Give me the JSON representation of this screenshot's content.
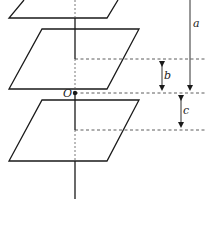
{
  "diagram": {
    "labels": {
      "a": "a",
      "b": "b",
      "c": "c",
      "origin": "O"
    },
    "elements": {
      "planes": [
        "top-plane",
        "middle-plane",
        "bottom-plane"
      ],
      "axis": "vertical-axis",
      "dimensions": [
        {
          "name": "a",
          "description": "distance from top to origin level"
        },
        {
          "name": "b",
          "description": "distance from middle dashed level to origin level"
        },
        {
          "name": "c",
          "description": "distance from origin level to lower dashed level"
        }
      ]
    },
    "colors": {
      "stroke": "#1a1a1a",
      "dashed": "#333333",
      "background": "#ffffff"
    }
  }
}
